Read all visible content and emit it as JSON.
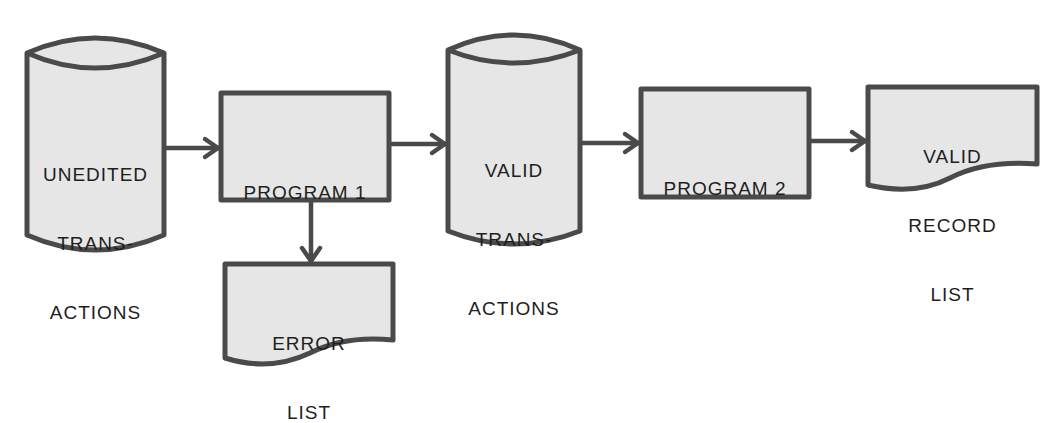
{
  "diagram": {
    "type": "system flowchart",
    "colors": {
      "stroke": "#4a4a4a",
      "fill": "#e6e6e6",
      "text": "#1e1e1e",
      "background": "#ffffff"
    },
    "nodes": [
      {
        "id": "unedited",
        "shape": "storage-cylinder",
        "lines": [
          "UNEDITED",
          "TRANS-",
          "ACTIONS"
        ]
      },
      {
        "id": "program1",
        "shape": "process-box",
        "lines": [
          "PROGRAM 1"
        ]
      },
      {
        "id": "valid",
        "shape": "storage-cylinder",
        "lines": [
          "VALID",
          "TRANS-",
          "ACTIONS"
        ]
      },
      {
        "id": "program2",
        "shape": "process-box",
        "lines": [
          "PROGRAM 2"
        ]
      },
      {
        "id": "validlist",
        "shape": "document",
        "lines": [
          "VALID",
          "RECORD",
          "LIST"
        ]
      },
      {
        "id": "errorlist",
        "shape": "document",
        "lines": [
          "ERROR",
          "LIST"
        ]
      }
    ],
    "edges": [
      {
        "from": "unedited",
        "to": "program1"
      },
      {
        "from": "program1",
        "to": "valid"
      },
      {
        "from": "valid",
        "to": "program2"
      },
      {
        "from": "program2",
        "to": "validlist"
      },
      {
        "from": "program1",
        "to": "errorlist"
      }
    ]
  }
}
